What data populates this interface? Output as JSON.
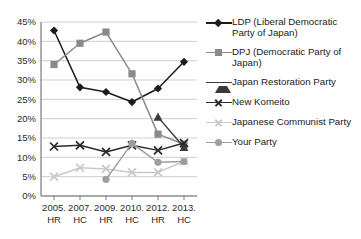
{
  "chart_data": {
    "type": "line",
    "title": "",
    "xlabel": "",
    "ylabel": "",
    "categories": [
      "2005. HR",
      "2007. HC",
      "2009. HR",
      "2010. HC",
      "2012. HR",
      "2013. HC"
    ],
    "category_lines": [
      [
        "2005.",
        "HR"
      ],
      [
        "2007.",
        "HC"
      ],
      [
        "2009.",
        "HR"
      ],
      [
        "2010.",
        "HC"
      ],
      [
        "2012.",
        "HR"
      ],
      [
        "2013.",
        "HC"
      ]
    ],
    "ylim": [
      0,
      45
    ],
    "ytick_step": 5,
    "ytick_labels": [
      "0%",
      "5%",
      "10%",
      "15%",
      "20%",
      "25%",
      "30%",
      "35%",
      "40%",
      "45%"
    ],
    "ytick_values": [
      0,
      5,
      10,
      15,
      20,
      25,
      30,
      35,
      40,
      45
    ],
    "grid": true,
    "legend_position": "right",
    "series": [
      {
        "name": "LDP (Liberal Democratic Party of Japan)",
        "short": "LDP",
        "marker": "diamond",
        "color": "#1c1c1c",
        "values": [
          42.8,
          28.1,
          26.9,
          24.3,
          27.8,
          34.7
        ]
      },
      {
        "name": "DPJ (Democratic Party of Japan)",
        "short": "DPJ",
        "marker": "square",
        "color": "#8a8a8a",
        "values": [
          34.0,
          39.5,
          42.4,
          31.6,
          16.0,
          13.4
        ]
      },
      {
        "name": "Japan Restoration Party",
        "short": "JRP",
        "marker": "triangle",
        "color": "#3a3a3a",
        "values": [
          null,
          null,
          null,
          null,
          20.4,
          12.6
        ]
      },
      {
        "name": "New Komeito",
        "short": "New Komeito",
        "marker": "x",
        "color": "#2b2b2b",
        "values": [
          12.8,
          13.1,
          11.4,
          13.1,
          11.8,
          13.7
        ]
      },
      {
        "name": "Japanese Communist Party",
        "short": "JCP",
        "marker": "x",
        "color": "#c9c9c9",
        "values": [
          5.0,
          7.3,
          7.0,
          6.1,
          6.1,
          9.0
        ]
      },
      {
        "name": "Your Party",
        "short": "Your Party",
        "marker": "circle",
        "color": "#9e9e9e",
        "values": [
          null,
          null,
          4.3,
          13.6,
          8.7,
          8.9
        ]
      }
    ]
  },
  "legend": {
    "items": [
      {
        "label": "LDP (Liberal Democratic Party of Japan)"
      },
      {
        "label": "DPJ (Democratic Party of Japan)"
      },
      {
        "label": "Japan Restoration Party"
      },
      {
        "label": "New Komeito"
      },
      {
        "label": "Japanese Communist Party"
      },
      {
        "label": "Your Party"
      }
    ]
  }
}
